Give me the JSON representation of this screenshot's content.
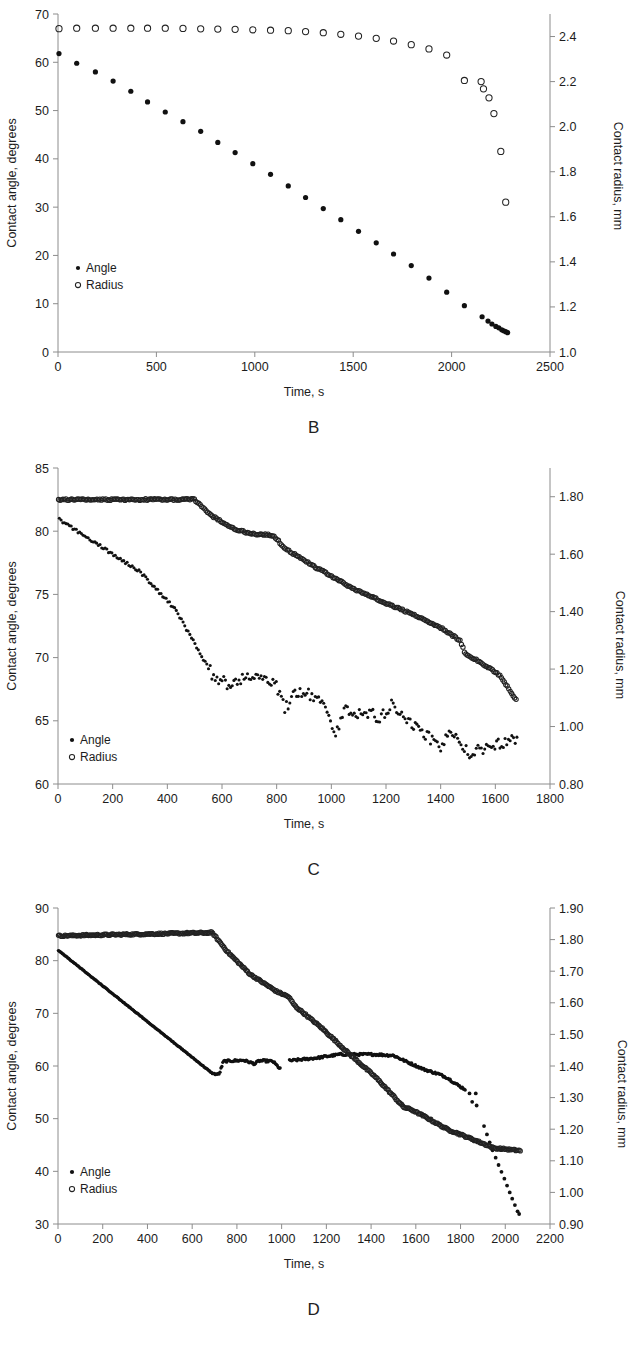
{
  "figure": {
    "panel_letters": [
      "B",
      "C",
      "D"
    ],
    "legend": {
      "angle_label": "Angle",
      "radius_label": "Radius",
      "angle_marker": "filled-circle",
      "radius_marker": "open-circle"
    },
    "axis_titles": {
      "x": "Time, s",
      "y_left": "Contact angle, degrees",
      "y_right": "Contact radius, mm"
    }
  },
  "chart_data": [
    {
      "type": "scatter",
      "panel": "A",
      "title": "",
      "xlabel": "Time, s",
      "ylabel": "Contact angle, degrees",
      "y2label": "Contact radius, mm",
      "xlim": [
        0,
        2500
      ],
      "ylim": [
        0,
        70
      ],
      "y2lim": [
        1.0,
        2.5
      ],
      "xticks": [
        0,
        500,
        1000,
        1500,
        2000,
        2500
      ],
      "yticks": [
        0,
        10,
        20,
        30,
        40,
        50,
        60,
        70
      ],
      "y2ticks": [
        1.0,
        1.2,
        1.4,
        1.6,
        1.8,
        2.0,
        2.2,
        2.4
      ],
      "grid": false,
      "legend_position": "lower-left",
      "series": [
        {
          "name": "Angle",
          "marker": "filled-circle",
          "axis": "left",
          "x": [
            5,
            95,
            190,
            280,
            370,
            455,
            545,
            635,
            725,
            812,
            900,
            990,
            1080,
            1170,
            1258,
            1348,
            1437,
            1527,
            1617,
            1705,
            1795,
            1885,
            1975,
            2065,
            2155,
            2185,
            2205,
            2225,
            2240,
            2255,
            2265,
            2275,
            2285
          ],
          "y": [
            61.8,
            59.8,
            58.0,
            56.1,
            54.0,
            51.8,
            49.7,
            47.7,
            45.7,
            43.4,
            41.3,
            39.0,
            36.8,
            34.4,
            32.0,
            29.7,
            27.4,
            25.0,
            22.6,
            20.3,
            17.9,
            15.3,
            12.4,
            9.6,
            7.3,
            6.4,
            5.8,
            5.3,
            5.0,
            4.6,
            4.4,
            4.2,
            4.0
          ]
        },
        {
          "name": "Radius",
          "marker": "open-circle",
          "axis": "right",
          "x": [
            5,
            95,
            190,
            280,
            370,
            455,
            545,
            635,
            725,
            812,
            900,
            990,
            1080,
            1170,
            1258,
            1348,
            1437,
            1527,
            1617,
            1705,
            1795,
            1885,
            1975,
            2065,
            2150,
            2162,
            2190,
            2215,
            2250,
            2275
          ],
          "y": [
            2.435,
            2.437,
            2.437,
            2.437,
            2.437,
            2.437,
            2.437,
            2.436,
            2.434,
            2.433,
            2.432,
            2.43,
            2.428,
            2.426,
            2.422,
            2.417,
            2.41,
            2.402,
            2.392,
            2.38,
            2.364,
            2.345,
            2.318,
            2.205,
            2.2,
            2.168,
            2.128,
            2.058,
            1.89,
            1.665
          ]
        }
      ]
    },
    {
      "type": "scatter",
      "panel": "C",
      "title": "",
      "xlabel": "Time, s",
      "ylabel": "Contact angle, degrees",
      "y2label": "Contact radius, mm",
      "xlim": [
        0,
        1800
      ],
      "ylim": [
        60,
        85
      ],
      "y2lim": [
        0.8,
        1.9
      ],
      "xticks": [
        0,
        200,
        400,
        600,
        800,
        1000,
        1200,
        1400,
        1600,
        1800
      ],
      "yticks": [
        60,
        65,
        70,
        75,
        80,
        85
      ],
      "y2ticks": [
        0.8,
        1.0,
        1.2,
        1.4,
        1.6,
        1.8
      ],
      "grid": false,
      "legend_position": "lower-left",
      "series": [
        {
          "name": "Angle",
          "marker": "filled-circle",
          "axis": "left",
          "note": "steady decline from 81 to ~68 by t=560, then noisy plateau drifting from 68 down to ~63 by t=1680"
        },
        {
          "name": "Radius",
          "marker": "open-circle",
          "axis": "right",
          "note": "flat at 1.79 until t=500, then steady decline with slope changes to 1.09 at t=1680"
        }
      ]
    },
    {
      "type": "scatter",
      "panel": "D",
      "title": "",
      "xlabel": "Time, s",
      "ylabel": "Contact angle, degrees",
      "y2label": "Contact radius, mm",
      "xlim": [
        0,
        2200
      ],
      "ylim": [
        30,
        90
      ],
      "y2lim": [
        0.9,
        1.9
      ],
      "xticks": [
        0,
        200,
        400,
        600,
        800,
        1000,
        1200,
        1400,
        1600,
        1800,
        2000,
        2200
      ],
      "yticks": [
        30,
        40,
        50,
        60,
        70,
        80,
        90
      ],
      "y2ticks": [
        0.9,
        1.0,
        1.1,
        1.2,
        1.3,
        1.4,
        1.5,
        1.6,
        1.7,
        1.8,
        1.9
      ],
      "grid": false,
      "legend_position": "lower-left",
      "series": [
        {
          "name": "Angle",
          "marker": "filled-circle",
          "axis": "left",
          "note": "linear decline 82 to 58.5 by t=700, plateau near 60-62 to t=1500, decline to 55.5 at t=1820, then steep drop to 32 at t=2060"
        },
        {
          "name": "Radius",
          "marker": "open-circle",
          "axis": "right",
          "note": "flat at 1.815 until t=700, steep decline to 1.14 at t=1950, then flat at 1.13 to t=2070"
        }
      ]
    }
  ]
}
